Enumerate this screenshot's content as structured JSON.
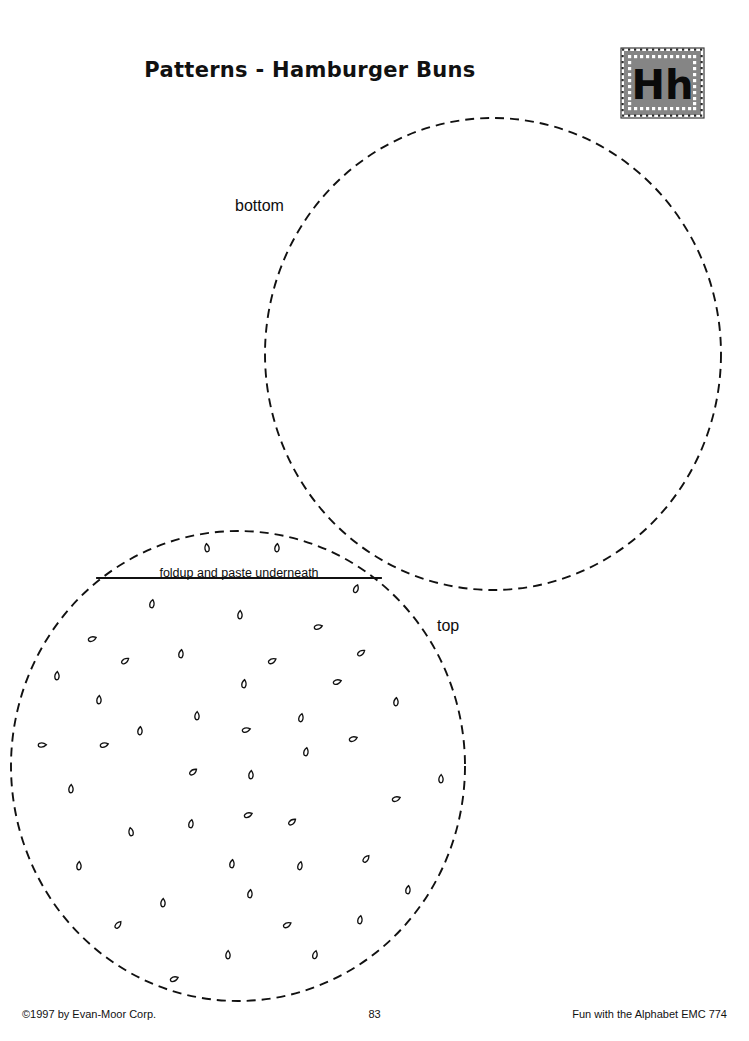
{
  "page": {
    "title": "Patterns - Hamburger Buns",
    "background_color": "#ffffff",
    "ink_color": "#000000"
  },
  "letter_badge": {
    "letters": "Hh",
    "fill_color": "#858585",
    "dot_color": "#ffffff",
    "border_color": "#3a3a3a",
    "name": "letter-h-badge"
  },
  "labels": {
    "bottom": "bottom",
    "top": "top",
    "fold_instruction": "foldup and paste underneath"
  },
  "footer": {
    "copyright": "©1997 by Evan-Moor Corp.",
    "page_number": "83",
    "series": "Fun with the Alphabet EMC 774"
  },
  "shapes": {
    "bottom_bun": {
      "label": "bottom",
      "cx": 493,
      "cy": 354,
      "rx": 228,
      "ry": 236,
      "stroke_style": "dashed",
      "dash": "9 6",
      "stroke_width": 1.9
    },
    "top_bun": {
      "label": "top",
      "cx": 238,
      "cy": 766,
      "rx": 227,
      "ry": 235,
      "stroke_style": "dashed",
      "dash": "9 6",
      "stroke_width": 1.9
    },
    "fold_line": {
      "x1": 97,
      "y1": 578,
      "x2": 381,
      "y2": 578,
      "stroke_width": 1.8,
      "stroke_style": "solid"
    }
  },
  "sesame_seeds": [
    {
      "x": 207,
      "y": 548,
      "r": -8
    },
    {
      "x": 277,
      "y": 548,
      "r": 6
    },
    {
      "x": 356,
      "y": 589,
      "r": 22
    },
    {
      "x": 152,
      "y": 604,
      "r": 10
    },
    {
      "x": 240,
      "y": 615,
      "r": 4
    },
    {
      "x": 318,
      "y": 627,
      "r": 75
    },
    {
      "x": 92,
      "y": 639,
      "r": 70
    },
    {
      "x": 181,
      "y": 654,
      "r": 8
    },
    {
      "x": 361,
      "y": 653,
      "r": 55
    },
    {
      "x": 125,
      "y": 661,
      "r": 55
    },
    {
      "x": 272,
      "y": 661,
      "r": 62
    },
    {
      "x": 57,
      "y": 676,
      "r": 5
    },
    {
      "x": 244,
      "y": 684,
      "r": 8
    },
    {
      "x": 337,
      "y": 682,
      "r": 72
    },
    {
      "x": 99,
      "y": 700,
      "r": 5
    },
    {
      "x": 396,
      "y": 702,
      "r": 6
    },
    {
      "x": 197,
      "y": 716,
      "r": 2
    },
    {
      "x": 301,
      "y": 718,
      "r": 12
    },
    {
      "x": 42,
      "y": 745,
      "r": 88
    },
    {
      "x": 140,
      "y": 731,
      "r": 6
    },
    {
      "x": 104,
      "y": 745,
      "r": 75
    },
    {
      "x": 246,
      "y": 730,
      "r": 76
    },
    {
      "x": 306,
      "y": 752,
      "r": 10
    },
    {
      "x": 353,
      "y": 739,
      "r": 70
    },
    {
      "x": 193,
      "y": 772,
      "r": 52
    },
    {
      "x": 251,
      "y": 775,
      "r": 5
    },
    {
      "x": 441,
      "y": 779,
      "r": 2
    },
    {
      "x": 71,
      "y": 789,
      "r": 4
    },
    {
      "x": 396,
      "y": 799,
      "r": 70
    },
    {
      "x": 191,
      "y": 824,
      "r": 10
    },
    {
      "x": 248,
      "y": 815,
      "r": 68
    },
    {
      "x": 292,
      "y": 822,
      "r": 52
    },
    {
      "x": 131,
      "y": 832,
      "r": 350
    },
    {
      "x": 366,
      "y": 859,
      "r": 40
    },
    {
      "x": 79,
      "y": 866,
      "r": 5
    },
    {
      "x": 232,
      "y": 864,
      "r": 8
    },
    {
      "x": 300,
      "y": 866,
      "r": 12
    },
    {
      "x": 408,
      "y": 890,
      "r": 8
    },
    {
      "x": 163,
      "y": 903,
      "r": 4
    },
    {
      "x": 250,
      "y": 894,
      "r": 8
    },
    {
      "x": 360,
      "y": 920,
      "r": 10
    },
    {
      "x": 118,
      "y": 925,
      "r": 40
    },
    {
      "x": 287,
      "y": 925,
      "r": 62
    },
    {
      "x": 228,
      "y": 955,
      "r": 2
    },
    {
      "x": 315,
      "y": 955,
      "r": 14
    },
    {
      "x": 174,
      "y": 979,
      "r": 68
    }
  ]
}
